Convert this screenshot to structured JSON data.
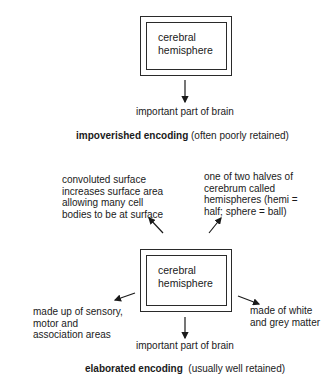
{
  "top_diagram": {
    "box_text_line1": "cerebral",
    "box_text_line2": "hemisphere",
    "arrow_label": "important part of brain",
    "caption_bold": "impoverished encoding",
    "caption_rest": " (often poorly retained)"
  },
  "bottom_diagram": {
    "box_text_line1": "cerebral",
    "box_text_line2": "hemisphere",
    "top_left_label": [
      "convoluted surface",
      "increases surface area",
      "allowing many cell",
      "bodies to be at surface"
    ],
    "top_right_label": [
      "one of two halves of",
      "cerebrum called",
      "hemispheres (hemi =",
      "half; sphere = ball)"
    ],
    "left_label": [
      "made up of sensory,",
      "motor and",
      "association areas"
    ],
    "right_label": [
      "made of white",
      "and grey matter"
    ],
    "bottom_label": "important part of brain",
    "caption_bold": "elaborated encoding",
    "caption_rest": "  (usually well retained)"
  }
}
